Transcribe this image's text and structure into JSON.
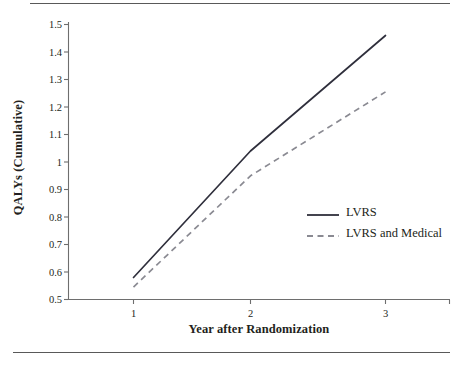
{
  "chart_data": {
    "type": "line",
    "title": "",
    "subtitle": "",
    "xlabel": "Year after Randomization",
    "ylabel": "QALYs (Cumulative)",
    "x": [
      1,
      2,
      3
    ],
    "xticklabels": [
      "1",
      "2",
      "3"
    ],
    "xlim": [
      0.55,
      3.55
    ],
    "ylim": [
      0.5,
      1.5
    ],
    "yticks": [
      0.5,
      0.6,
      0.7,
      0.8,
      0.9,
      1.0,
      1.1,
      1.2,
      1.3,
      1.4,
      1.5
    ],
    "yticklabels": [
      "0.5",
      "0.6",
      "0.7",
      "0.8",
      "0.9",
      "1",
      "1.1",
      "1.2",
      "1.3",
      "1.4",
      "1.5"
    ],
    "grid": false,
    "legend_position": "center-right",
    "series": [
      {
        "name": "LVRS",
        "style": "solid",
        "color": "#2f2f3c",
        "values": [
          0.58,
          1.04,
          1.46
        ]
      },
      {
        "name": "LVRS and Medical",
        "style": "dashed",
        "color": "#8a8a92",
        "values": [
          0.545,
          0.95,
          1.255
        ]
      }
    ]
  },
  "axes": {
    "ylabel": "QALYs (Cumulative)",
    "xlabel": "Year after Randomization",
    "yticklabels": [
      "1.5",
      "1.4",
      "1.3",
      "1.2",
      "1.1",
      "1",
      "0.9",
      "0.8",
      "0.7",
      "0.6",
      "0.5"
    ],
    "xticklabels": [
      "1",
      "2",
      "3"
    ]
  },
  "legend": {
    "items": [
      {
        "label": "LVRS",
        "style": "solid"
      },
      {
        "label": "LVRS and Medical",
        "style": "dashed"
      }
    ]
  },
  "colors": {
    "solid_series": "#2f2f3c",
    "dashed_series": "#8a8a92",
    "axis": "#6e6e6e",
    "rule": "#595959",
    "text": "#231f20",
    "background": "#ffffff"
  }
}
